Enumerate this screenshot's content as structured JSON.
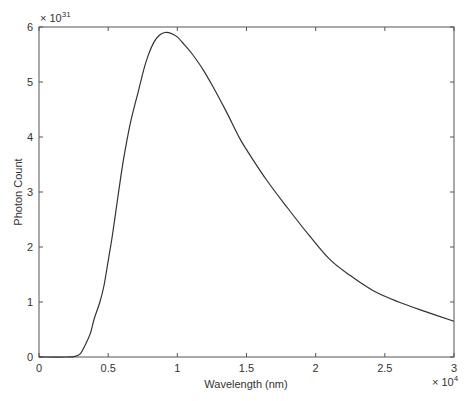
{
  "chart_data": {
    "type": "line",
    "title": "",
    "xlabel": "Wavelength (nm)",
    "ylabel": "Photon Count",
    "x_multiplier_label": "× 10",
    "x_multiplier_exp": "4",
    "y_multiplier_label": "× 10",
    "y_multiplier_exp": "31",
    "xlim": [
      0,
      3
    ],
    "ylim": [
      0,
      6
    ],
    "x_scale": 10000,
    "y_scale": 1e+31,
    "grid": false,
    "legend": false,
    "x_ticks": [
      "0",
      "0.5",
      "1",
      "1.5",
      "2",
      "2.5",
      "3"
    ],
    "y_ticks": [
      "0",
      "1",
      "2",
      "3",
      "4",
      "5",
      "6"
    ],
    "series": [
      {
        "name": "Photon Count",
        "color": "#333333",
        "x": [
          0,
          0.2,
          0.26,
          0.3,
          0.33,
          0.37,
          0.4,
          0.44,
          0.47,
          0.5,
          0.53,
          0.57,
          0.61,
          0.66,
          0.72,
          0.76,
          0.79,
          0.83,
          0.87,
          0.91,
          0.95,
          1.0,
          1.05,
          1.11,
          1.18,
          1.25,
          1.35,
          1.45,
          1.51,
          1.65,
          1.8,
          1.95,
          2.1,
          2.25,
          2.42,
          2.6,
          2.8,
          3.0
        ],
        "values": [
          0,
          0,
          0.01,
          0.06,
          0.2,
          0.42,
          0.7,
          1.0,
          1.3,
          1.75,
          2.2,
          2.9,
          3.58,
          4.25,
          4.85,
          5.25,
          5.49,
          5.72,
          5.85,
          5.9,
          5.89,
          5.82,
          5.68,
          5.5,
          5.25,
          4.95,
          4.48,
          3.98,
          3.73,
          3.2,
          2.7,
          2.22,
          1.78,
          1.48,
          1.2,
          1.0,
          0.82,
          0.65
        ]
      }
    ]
  }
}
